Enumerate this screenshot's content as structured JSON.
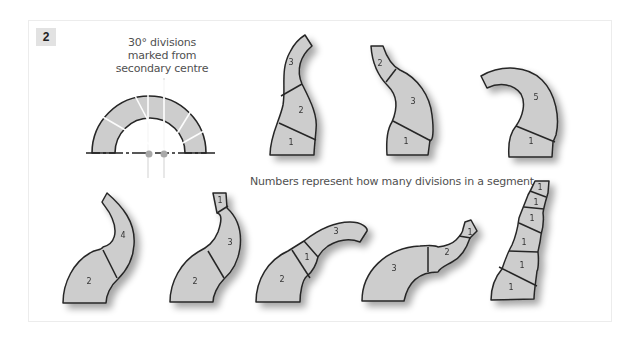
{
  "figure": {
    "number": "2",
    "annotation_top": [
      "30° divisions",
      "marked from",
      "secondary centre"
    ],
    "annotation_middle": "Numbers represent how many divisions in a segment",
    "colors": {
      "segment_fill": "#cdcdcd",
      "outline": "#262626",
      "ray": "#ffffff",
      "centre_dot": "#a8a8a8",
      "badge_bg": "#e2e2e2",
      "text": "#505050"
    },
    "construction": {
      "division_angle_deg": 30,
      "centres": 2
    },
    "shapes": [
      {
        "id": "top-1",
        "labels": [
          "3",
          "2",
          "1"
        ]
      },
      {
        "id": "top-2",
        "labels": [
          "2",
          "3",
          "1"
        ]
      },
      {
        "id": "top-3",
        "labels": [
          "5",
          "1"
        ]
      },
      {
        "id": "bottom-1",
        "labels": [
          "4",
          "2"
        ]
      },
      {
        "id": "bottom-2",
        "labels": [
          "1",
          "3",
          "2"
        ]
      },
      {
        "id": "bottom-3",
        "labels": [
          "3",
          "1",
          "2"
        ]
      },
      {
        "id": "bottom-4",
        "labels": [
          "1",
          "2",
          "3"
        ]
      },
      {
        "id": "bottom-5",
        "labels": [
          "1",
          "1",
          "1",
          "1",
          "1",
          "1"
        ]
      }
    ]
  }
}
